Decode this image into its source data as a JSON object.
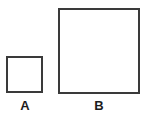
{
  "figure": {
    "background_color": "#ffffff",
    "stroke_color": "#3a3a3a",
    "label_color": "#1c1c1c",
    "shapes": [
      {
        "id": "a",
        "label": "A",
        "type": "square",
        "x": 6,
        "y": 56,
        "width": 37,
        "height": 37,
        "border_width": 2,
        "fill": "#ffffff"
      },
      {
        "id": "b",
        "label": "B",
        "type": "square",
        "x": 58,
        "y": 8,
        "width": 82,
        "height": 86,
        "border_width": 2,
        "fill": "#ffffff"
      }
    ]
  }
}
